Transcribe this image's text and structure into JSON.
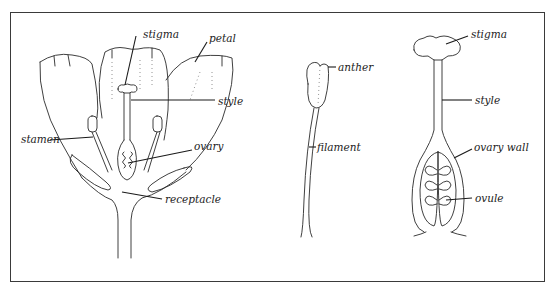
{
  "figure": {
    "panels": [
      {
        "id": "flower-section",
        "labels": {
          "stigma": "stigma",
          "petal": "petal",
          "style": "style",
          "stamen": "stamen",
          "ovary": "ovary",
          "receptacle": "receptacle"
        }
      },
      {
        "id": "stamen",
        "labels": {
          "anther": "anther",
          "filament": "filament"
        }
      },
      {
        "id": "pistil",
        "labels": {
          "stigma": "stigma",
          "style": "style",
          "ovary_wall": "ovary wall",
          "ovule": "ovule"
        }
      }
    ]
  }
}
